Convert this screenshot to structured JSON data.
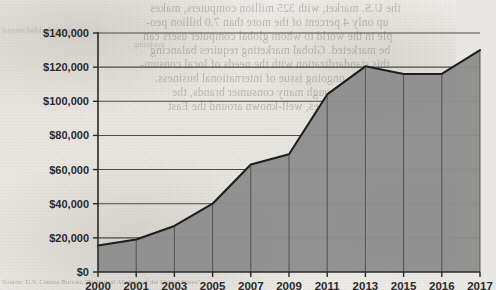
{
  "chart_data": {
    "type": "area",
    "title": "",
    "subtitle": "",
    "xlabel": "",
    "ylabel": "",
    "categories": [
      "2000",
      "2001",
      "2003",
      "2005",
      "2007",
      "2009",
      "2011",
      "2013",
      "2015",
      "2016",
      "2017"
    ],
    "values": [
      15500,
      19000,
      27000,
      40000,
      63000,
      69000,
      104000,
      120500,
      116000,
      116000,
      130000
    ],
    "series": [
      {
        "name": "",
        "values": [
          15500,
          19000,
          27000,
          40000,
          63000,
          69000,
          104000,
          120500,
          116000,
          116000,
          130000
        ]
      }
    ],
    "ylim": [
      0,
      140000
    ],
    "y_ticks": [
      0,
      20000,
      40000,
      60000,
      80000,
      100000,
      120000,
      140000
    ],
    "y_tick_labels": [
      "$0",
      "$20,000",
      "$40,000",
      "$60,000",
      "$80,000",
      "$100,000",
      "$120,000",
      "$140,000"
    ],
    "x_tick_labels": [
      "2000",
      "2001",
      "2003",
      "2005",
      "2007",
      "2009",
      "2011",
      "2013",
      "2015",
      "2016",
      "2017"
    ],
    "grid": true,
    "grid_axis": "y",
    "legend": false,
    "legend_position": "none",
    "annotations": [],
    "fill_color": "#8e8e8e",
    "line_color": "#1e1e1e",
    "gridline_color": "#4a4a4a",
    "axis_color": "#2a2a2a",
    "dropline_color": "#3c3c3c"
  },
  "artifacts": {
    "bleed_through_visible": true,
    "bleed_lines": [
      "the U.S. market, with 325 million computers, makes",
      "up only 4 percent of the more than 7.0 billion peo-",
      "ple in the world to whom global computer users can",
      "be marketed. Global marketing requires balancing",
      "this standardization with the needs of local consum-",
      "ers, an ongoing issue of international business.",
      "even though many consumer brands, the",
      "company names, well-known around the East"
    ],
    "bleed_margin_notes": [
      "margin 1 global internal",
      "marketing"
    ],
    "bottom_caption": "Source: U.S. Census Bureau, \"Statistical Abstract of the United States\""
  }
}
